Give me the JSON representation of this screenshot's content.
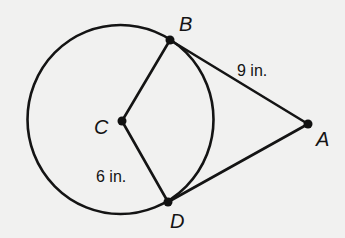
{
  "figure": {
    "type": "geometry",
    "colors": {
      "background": "#f1f1f0",
      "ink": "#141414"
    },
    "circle": {
      "center_point": "C",
      "cx": 120.5,
      "cy": 119.5,
      "rx": 93,
      "ry": 94.5
    },
    "points": {
      "A": {
        "label": "A",
        "x": 308,
        "y": 124,
        "label_x": 316,
        "label_y": 146
      },
      "B": {
        "label": "B",
        "x": 170,
        "y": 40,
        "label_x": 179,
        "label_y": 31
      },
      "C": {
        "label": "C",
        "x": 122,
        "y": 121,
        "label_x": 94,
        "label_y": 134
      },
      "D": {
        "label": "D",
        "x": 168,
        "y": 202,
        "label_x": 170,
        "label_y": 228
      }
    },
    "segments": [
      {
        "name": "radius-CB",
        "from": "C",
        "to": "B"
      },
      {
        "name": "radius-CD",
        "from": "C",
        "to": "D"
      },
      {
        "name": "tangent-AB",
        "from": "A",
        "to": "B"
      },
      {
        "name": "tangent-AD",
        "from": "A",
        "to": "D"
      }
    ],
    "measurements": {
      "AB": {
        "text": "9 in.",
        "x": 237,
        "y": 76
      },
      "CD": {
        "text": "6 in.",
        "x": 96,
        "y": 182
      }
    }
  }
}
